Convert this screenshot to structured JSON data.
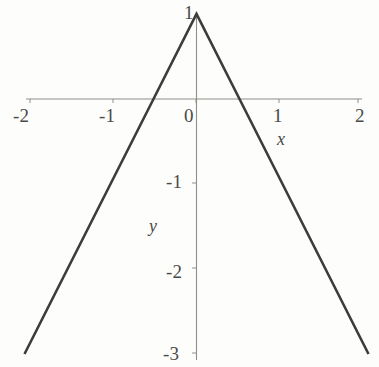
{
  "figure": {
    "background_color": "#fdfdfb",
    "curve_color": "#3c3c3a",
    "axis_color": "#8e8e8a",
    "text_color": "#4a4a48"
  },
  "axis_names": {
    "x": "x",
    "y": "y"
  },
  "x_tick_labels": {
    "neg2": "-2",
    "neg1": "-1",
    "zero": "0",
    "one": "1",
    "two": "2"
  },
  "y_tick_labels": {
    "one": "1",
    "neg1": "-1",
    "neg2": "-2",
    "neg3": "-3"
  },
  "chart_data": {
    "type": "line",
    "title": "",
    "xlabel": "x",
    "ylabel": "y",
    "xlim": [
      -2,
      2
    ],
    "ylim": [
      -3,
      1
    ],
    "xticks": [
      -2,
      -1,
      0,
      1,
      2
    ],
    "yticks": [
      -3,
      -2,
      -1,
      1
    ],
    "grid": false,
    "legend": "none",
    "series": [
      {
        "name": "y = 1 - 2|x|",
        "x": [
          -2,
          -1.5,
          -1,
          -0.5,
          0,
          0.5,
          1,
          1.5,
          2
        ],
        "values": [
          -3,
          -2,
          -1,
          0,
          1,
          0,
          -1,
          -2,
          -3
        ]
      }
    ],
    "annotations": [
      {
        "text": "x",
        "x": 1.05,
        "y": -0.42
      },
      {
        "text": "y",
        "x": -0.52,
        "y": -1.55
      }
    ]
  }
}
